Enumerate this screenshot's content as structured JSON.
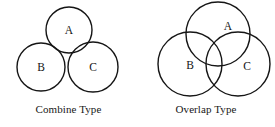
{
  "figure": {
    "background_color": "#ffffff",
    "stroke_color": "#151515",
    "width": 275,
    "height": 127,
    "panels": [
      {
        "id": "combine",
        "caption": "Combine Type",
        "relation": "tangent",
        "circles": [
          {
            "label": "A",
            "cx": 69,
            "cy": 30,
            "r": 23,
            "position": "top"
          },
          {
            "label": "B",
            "cx": 41,
            "cy": 67,
            "r": 24,
            "position": "bottom-left"
          },
          {
            "label": "C",
            "cx": 93,
            "cy": 67,
            "r": 25,
            "position": "bottom-right"
          }
        ]
      },
      {
        "id": "overlap",
        "caption": "Overlap Type",
        "relation": "overlapping",
        "circles": [
          {
            "label": "A",
            "cx": 218,
            "cy": 34,
            "r": 32,
            "position": "top"
          },
          {
            "label": "B",
            "cx": 190,
            "cy": 64,
            "r": 32,
            "position": "bottom-left"
          },
          {
            "label": "C",
            "cx": 238,
            "cy": 64,
            "r": 32,
            "position": "bottom-right"
          }
        ]
      }
    ],
    "labels": {
      "combine_a": "A",
      "combine_b": "B",
      "combine_c": "C",
      "overlap_a": "A",
      "overlap_b": "B",
      "overlap_c": "C"
    }
  }
}
